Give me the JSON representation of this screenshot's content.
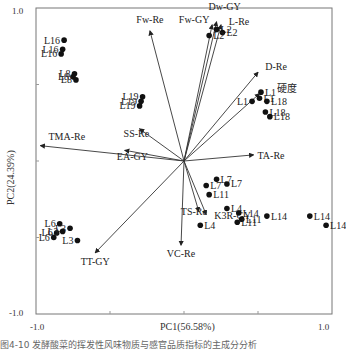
{
  "chart_data": {
    "type": "scatter",
    "subtype": "PCA biplot",
    "title": "",
    "xlabel": "PC1(56.58%)",
    "ylabel": "PC2(24.39%)",
    "xlim": [
      -1.0,
      1.0
    ],
    "ylim": [
      -1.0,
      1.0
    ],
    "x_ticks": [
      "-1.0",
      "1.0"
    ],
    "y_ticks": [
      "1.0",
      "-1.0"
    ],
    "grid": false,
    "legend": null,
    "loadings": [
      {
        "name": "Fw-Re",
        "x": -0.23,
        "y": 0.85
      },
      {
        "name": "Dw-GY",
        "x": 0.22,
        "y": 0.91
      },
      {
        "name": "Fw-GY",
        "x": 0.19,
        "y": 0.89
      },
      {
        "name": "L-Re",
        "x": 0.25,
        "y": 0.89
      },
      {
        "name": "D-Re",
        "x": 0.5,
        "y": 0.58
      },
      {
        "name": "硬度",
        "x": 0.51,
        "y": 0.44
      },
      {
        "name": "TA-Re",
        "x": 0.47,
        "y": 0.04
      },
      {
        "name": "TMA-Re",
        "x": -0.97,
        "y": 0.1
      },
      {
        "name": "EA-GY",
        "x": -0.4,
        "y": 0.07
      },
      {
        "name": "SS-Re",
        "x": -0.3,
        "y": 0.21
      },
      {
        "name": "TS-Re",
        "x": 0.1,
        "y": -0.33
      },
      {
        "name": "K3R-GY",
        "x": 0.15,
        "y": -0.35
      },
      {
        "name": "VC-Re",
        "x": -0.02,
        "y": -0.55
      },
      {
        "name": "TT-GY",
        "x": -0.6,
        "y": -0.6
      }
    ],
    "scores": [
      {
        "name": "L2",
        "x": 0.22,
        "y": 0.86
      },
      {
        "name": "L2",
        "x": 0.26,
        "y": 0.84
      },
      {
        "name": "L2",
        "x": 0.17,
        "y": 0.82
      },
      {
        "name": "L16",
        "x": -0.81,
        "y": 0.79
      },
      {
        "name": "L16",
        "x": -0.82,
        "y": 0.73
      },
      {
        "name": "L16",
        "x": -0.83,
        "y": 0.7
      },
      {
        "name": "L8",
        "x": -0.74,
        "y": 0.57
      },
      {
        "name": "L8",
        "x": -0.75,
        "y": 0.55
      },
      {
        "name": "L8",
        "x": -0.73,
        "y": 0.53
      },
      {
        "name": "L19",
        "x": -0.28,
        "y": 0.42
      },
      {
        "name": "L19",
        "x": -0.29,
        "y": 0.39
      },
      {
        "name": "L19",
        "x": -0.3,
        "y": 0.36
      },
      {
        "name": "L1",
        "x": 0.52,
        "y": 0.45
      },
      {
        "name": "L1",
        "x": 0.46,
        "y": 0.39
      },
      {
        "name": "L1",
        "x": 0.51,
        "y": 0.41
      },
      {
        "name": "L18",
        "x": 0.56,
        "y": 0.39
      },
      {
        "name": "L18",
        "x": 0.55,
        "y": 0.32
      },
      {
        "name": "L18",
        "x": 0.58,
        "y": 0.29
      },
      {
        "name": "L7",
        "x": 0.22,
        "y": -0.12
      },
      {
        "name": "L7",
        "x": 0.15,
        "y": -0.16
      },
      {
        "name": "L7",
        "x": 0.29,
        "y": -0.15
      },
      {
        "name": "L11",
        "x": 0.17,
        "y": -0.22
      },
      {
        "name": "L4",
        "x": 0.29,
        "y": -0.31
      },
      {
        "name": "L14",
        "x": 0.37,
        "y": -0.34
      },
      {
        "name": "L11",
        "x": 0.39,
        "y": -0.38
      },
      {
        "name": "L11",
        "x": 0.36,
        "y": -0.4
      },
      {
        "name": "L4",
        "x": 0.11,
        "y": -0.42
      },
      {
        "name": "L14",
        "x": 0.56,
        "y": -0.36
      },
      {
        "name": "L14",
        "x": 0.85,
        "y": -0.36
      },
      {
        "name": "L14",
        "x": 0.96,
        "y": -0.42
      },
      {
        "name": "L6",
        "x": -0.84,
        "y": -0.41
      },
      {
        "name": "L6",
        "x": -0.86,
        "y": -0.47
      },
      {
        "name": "L6",
        "x": -0.88,
        "y": -0.5
      },
      {
        "name": "L3",
        "x": -0.77,
        "y": -0.44
      },
      {
        "name": "L3",
        "x": -0.82,
        "y": -0.46
      },
      {
        "name": "L3",
        "x": -0.72,
        "y": -0.52
      }
    ]
  },
  "caption": "图4-10 发酵酸菜的挥发性风味物质与感官品质指标的主成分分析"
}
